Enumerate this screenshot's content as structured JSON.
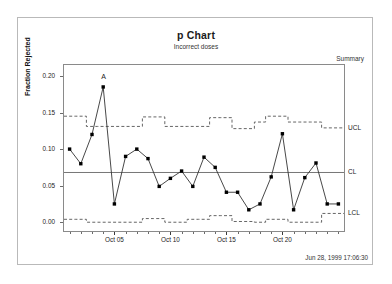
{
  "header": {
    "title": "p Chart",
    "subtitle": "Incorrect doses",
    "summary_label": "Summary",
    "timestamp": "Jun 28, 1999 17:06:30"
  },
  "annotations": {
    "violation_label": "A",
    "violation_index": 4,
    "violation_value": 0.185
  },
  "limit_labels": {
    "ucl": "UCL",
    "cl": "CL",
    "lcl": "LCL"
  },
  "colors": {
    "line": "#333333",
    "marker": "#000000",
    "center_line": "#777777",
    "limit_line": "#555555",
    "axis": "#8a8a8a",
    "frame": "#b9b9b9",
    "text": "#222222"
  },
  "chart_data": {
    "type": "line",
    "title": "p Chart",
    "subtitle": "Incorrect doses",
    "xlabel": "",
    "ylabel": "Fraction Rejected",
    "ylim": [
      -0.012,
      0.215
    ],
    "yticks": [
      0.0,
      0.05,
      0.1,
      0.15,
      0.2
    ],
    "ytick_labels": [
      "0.00",
      "0.05",
      "0.10",
      "0.15",
      "0.20"
    ],
    "xlim": [
      0.5,
      25.5
    ],
    "xtick_positions": [
      5,
      10,
      15,
      20
    ],
    "xtick_labels": [
      "Oct 05",
      "Oct 10",
      "Oct 15",
      "Oct 20"
    ],
    "x_minor_count": 25,
    "grid": false,
    "legend": "right-labels",
    "center_line": 0.068,
    "series": [
      {
        "name": "Fraction Rejected",
        "x": [
          1,
          2,
          3,
          4,
          5,
          6,
          7,
          8,
          9,
          10,
          11,
          12,
          13,
          14,
          15,
          16,
          17,
          18,
          19,
          20,
          21,
          22,
          23,
          24,
          25
        ],
        "values": [
          0.1,
          0.08,
          0.12,
          0.185,
          0.025,
          0.09,
          0.1,
          0.087,
          0.049,
          0.06,
          0.07,
          0.049,
          0.089,
          0.075,
          0.041,
          0.041,
          0.017,
          0.025,
          0.062,
          0.121,
          0.017,
          0.061,
          0.081,
          0.025,
          0.025
        ]
      },
      {
        "name": "UCL",
        "style": "stepped-dashed",
        "values": [
          0.145,
          0.145,
          0.131,
          0.131,
          0.131,
          0.131,
          0.131,
          0.144,
          0.144,
          0.131,
          0.131,
          0.131,
          0.131,
          0.143,
          0.143,
          0.128,
          0.128,
          0.137,
          0.145,
          0.145,
          0.137,
          0.137,
          0.137,
          0.129,
          0.129
        ]
      },
      {
        "name": "LCL",
        "style": "stepped-dashed",
        "values": [
          0.004,
          0.004,
          0.0,
          0.0,
          0.0,
          0.0,
          0.0,
          0.005,
          0.005,
          0.0,
          0.0,
          0.004,
          0.004,
          0.009,
          0.009,
          0.001,
          0.001,
          0.0,
          0.004,
          0.004,
          0.0,
          0.0,
          0.0,
          0.012,
          0.012
        ]
      }
    ]
  }
}
